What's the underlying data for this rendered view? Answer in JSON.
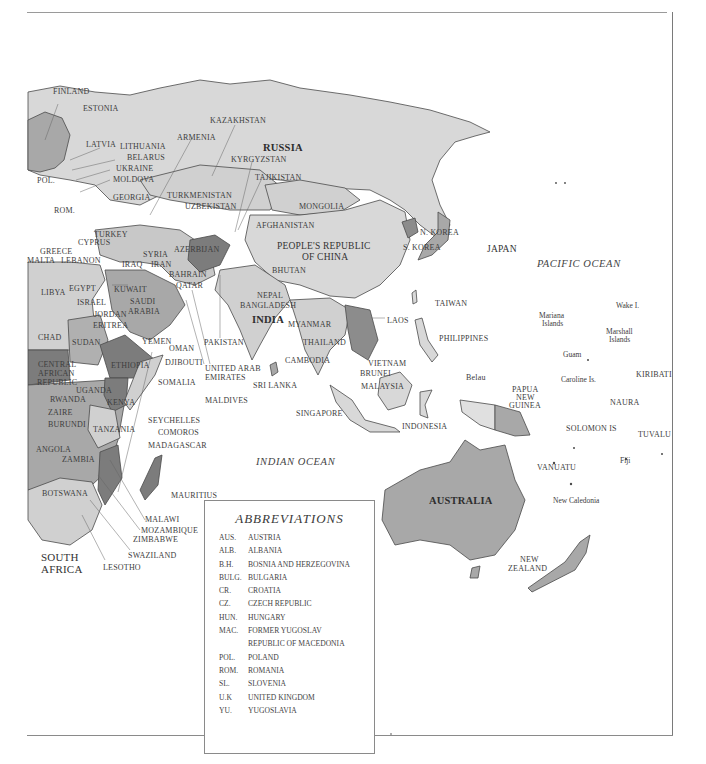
{
  "map": {
    "oceans": [
      {
        "id": "pacific",
        "label": "PACIFIC OCEAN",
        "x": 537,
        "y": 259
      },
      {
        "id": "indian",
        "label": "INDIAN OCEAN",
        "x": 256,
        "y": 457
      }
    ],
    "major_labels": [
      {
        "id": "russia",
        "label": "RUSSIA",
        "x": 263,
        "y": 142
      },
      {
        "id": "china-1",
        "label": "PEOPLE'S REPUBLIC",
        "x": 277,
        "y": 241
      },
      {
        "id": "china-2",
        "label": "OF CHINA",
        "x": 302,
        "y": 252
      },
      {
        "id": "india",
        "label": "INDIA",
        "x": 252,
        "y": 314
      },
      {
        "id": "japan",
        "label": "JAPAN",
        "x": 487,
        "y": 244
      },
      {
        "id": "australia",
        "label": "AUSTRALIA",
        "x": 429,
        "y": 495
      },
      {
        "id": "south-africa-1",
        "label": "SOUTH",
        "x": 41,
        "y": 552
      },
      {
        "id": "south-africa-2",
        "label": "AFRICA",
        "x": 41,
        "y": 564
      }
    ],
    "labels": [
      {
        "id": "finland",
        "label": "FINLAND",
        "x": 53,
        "y": 87
      },
      {
        "id": "estonia",
        "label": "ESTONIA",
        "x": 83,
        "y": 104
      },
      {
        "id": "kazakhstan",
        "label": "KAZAKHSTAN",
        "x": 210,
        "y": 116
      },
      {
        "id": "armenia",
        "label": "ARMENIA",
        "x": 177,
        "y": 133
      },
      {
        "id": "latvia",
        "label": "LATVIA",
        "x": 86,
        "y": 140
      },
      {
        "id": "lithuania",
        "label": "LITHUANIA",
        "x": 120,
        "y": 142
      },
      {
        "id": "belarus",
        "label": "BELARUS",
        "x": 127,
        "y": 153
      },
      {
        "id": "kyrgyzstan",
        "label": "KYRGYZSTAN",
        "x": 231,
        "y": 155
      },
      {
        "id": "ukraine",
        "label": "UKRAINE",
        "x": 116,
        "y": 164
      },
      {
        "id": "pol",
        "label": "POL.",
        "x": 37,
        "y": 176
      },
      {
        "id": "moldova",
        "label": "MOLDOVA",
        "x": 113,
        "y": 175
      },
      {
        "id": "tajikistan",
        "label": "TAJIKISTAN",
        "x": 255,
        "y": 173
      },
      {
        "id": "georgia",
        "label": "GEORGIA",
        "x": 113,
        "y": 193
      },
      {
        "id": "turkmenistan",
        "label": "TURKMENISTAN",
        "x": 167,
        "y": 191
      },
      {
        "id": "uzbekistan",
        "label": "UZBEKISTAN",
        "x": 185,
        "y": 202
      },
      {
        "id": "mongolia",
        "label": "MONGOLIA",
        "x": 299,
        "y": 202
      },
      {
        "id": "rom",
        "label": "ROM.",
        "x": 54,
        "y": 206
      },
      {
        "id": "afghanistan",
        "label": "AFGHANISTAN",
        "x": 256,
        "y": 221
      },
      {
        "id": "turkey",
        "label": "TURKEY",
        "x": 94,
        "y": 230
      },
      {
        "id": "cyprus",
        "label": "CYPRUS",
        "x": 78,
        "y": 238
      },
      {
        "id": "greece",
        "label": "GREECE",
        "x": 40,
        "y": 247
      },
      {
        "id": "syria",
        "label": "SYRIA",
        "x": 143,
        "y": 250
      },
      {
        "id": "azerbaijan",
        "label": "AZERBIJAN",
        "x": 174,
        "y": 245
      },
      {
        "id": "malta",
        "label": "MALTA",
        "x": 27,
        "y": 256
      },
      {
        "id": "lebanon",
        "label": "LEBANON",
        "x": 61,
        "y": 256
      },
      {
        "id": "iraq",
        "label": "IRAQ",
        "x": 122,
        "y": 260
      },
      {
        "id": "iran",
        "label": "IRAN",
        "x": 151,
        "y": 260
      },
      {
        "id": "n-korea",
        "label": "N. KOREA",
        "x": 420,
        "y": 228
      },
      {
        "id": "s-korea",
        "label": "S. KOREA",
        "x": 403,
        "y": 243
      },
      {
        "id": "bhutan",
        "label": "BHUTAN",
        "x": 272,
        "y": 266
      },
      {
        "id": "bahrain",
        "label": "BAHRAIN",
        "x": 169,
        "y": 270
      },
      {
        "id": "qatar",
        "label": "QATAR",
        "x": 176,
        "y": 281
      },
      {
        "id": "libya",
        "label": "LIBYA",
        "x": 41,
        "y": 288
      },
      {
        "id": "egypt",
        "label": "EGYPT",
        "x": 69,
        "y": 284
      },
      {
        "id": "kuwait",
        "label": "KUWAIT",
        "x": 114,
        "y": 285
      },
      {
        "id": "nepal",
        "label": "NEPAL",
        "x": 257,
        "y": 291
      },
      {
        "id": "bangladesh",
        "label": "BANGLADESH",
        "x": 240,
        "y": 301
      },
      {
        "id": "israel",
        "label": "ISRAEL",
        "x": 77,
        "y": 298
      },
      {
        "id": "saudi-1",
        "label": "SAUDI",
        "x": 130,
        "y": 297
      },
      {
        "id": "saudi-2",
        "label": "ARABIA",
        "x": 128,
        "y": 307
      },
      {
        "id": "taiwan",
        "label": "TAIWAN",
        "x": 435,
        "y": 299
      },
      {
        "id": "laos",
        "label": "LAOS",
        "x": 387,
        "y": 316
      },
      {
        "id": "jordan",
        "label": "JORDAN",
        "x": 94,
        "y": 310
      },
      {
        "id": "myanmar",
        "label": "MYANMAR",
        "x": 288,
        "y": 320
      },
      {
        "id": "eritrea",
        "label": "ERITREA",
        "x": 93,
        "y": 321
      },
      {
        "id": "chad",
        "label": "CHAD",
        "x": 38,
        "y": 333
      },
      {
        "id": "sudan",
        "label": "SUDAN",
        "x": 72,
        "y": 338
      },
      {
        "id": "yemen",
        "label": "YEMEN",
        "x": 142,
        "y": 337
      },
      {
        "id": "pakistan",
        "label": "PAKISTAN",
        "x": 204,
        "y": 338
      },
      {
        "id": "thailand",
        "label": "THAILAND",
        "x": 303,
        "y": 338
      },
      {
        "id": "philippines",
        "label": "PHILIPPINES",
        "x": 439,
        "y": 334
      },
      {
        "id": "oman",
        "label": "OMAN",
        "x": 169,
        "y": 344
      },
      {
        "id": "cambodia",
        "label": "CAMBODIA",
        "x": 285,
        "y": 356
      },
      {
        "id": "car-1",
        "label": "CENTRAL",
        "x": 38,
        "y": 360
      },
      {
        "id": "car-2",
        "label": "AFRICAN",
        "x": 38,
        "y": 369
      },
      {
        "id": "car-3",
        "label": "REPUBLIC",
        "x": 37,
        "y": 378
      },
      {
        "id": "ethiopia",
        "label": "ETHIOPIA",
        "x": 111,
        "y": 361
      },
      {
        "id": "djibouti",
        "label": "DJIBOUTI",
        "x": 165,
        "y": 358
      },
      {
        "id": "uae-1",
        "label": "UNITED ARAB",
        "x": 205,
        "y": 364
      },
      {
        "id": "uae-2",
        "label": "EMIRATES",
        "x": 205,
        "y": 373
      },
      {
        "id": "vietnam",
        "label": "VIETNAM",
        "x": 368,
        "y": 359
      },
      {
        "id": "brunei",
        "label": "BRUNEI",
        "x": 360,
        "y": 369
      },
      {
        "id": "belau",
        "label": "Belau",
        "x": 466,
        "y": 373
      },
      {
        "id": "somalia",
        "label": "SOMALIA",
        "x": 158,
        "y": 378
      },
      {
        "id": "sri-lanka",
        "label": "SRI LANKA",
        "x": 253,
        "y": 381
      },
      {
        "id": "malaysia",
        "label": "MALAYSIA",
        "x": 361,
        "y": 382
      },
      {
        "id": "uganda",
        "label": "UGANDA",
        "x": 76,
        "y": 386
      },
      {
        "id": "rwanda",
        "label": "RWANDA",
        "x": 50,
        "y": 395
      },
      {
        "id": "kenya",
        "label": "KENYA",
        "x": 107,
        "y": 398
      },
      {
        "id": "maldives",
        "label": "MALDIVES",
        "x": 205,
        "y": 396
      },
      {
        "id": "zaire",
        "label": "ZAIRE",
        "x": 48,
        "y": 408
      },
      {
        "id": "singapore",
        "label": "SINGAPORE",
        "x": 296,
        "y": 409
      },
      {
        "id": "burundi",
        "label": "BURUNDI",
        "x": 48,
        "y": 420
      },
      {
        "id": "seychelles",
        "label": "SEYCHELLES",
        "x": 148,
        "y": 416
      },
      {
        "id": "tanzania",
        "label": "TANZANIA",
        "x": 93,
        "y": 425
      },
      {
        "id": "indonesia",
        "label": "INDONESIA",
        "x": 402,
        "y": 422
      },
      {
        "id": "comoros",
        "label": "COMOROS",
        "x": 158,
        "y": 428
      },
      {
        "id": "madagascar",
        "label": "MADAGASCAR",
        "x": 148,
        "y": 441
      },
      {
        "id": "angola",
        "label": "ANGOLA",
        "x": 36,
        "y": 445
      },
      {
        "id": "zambia",
        "label": "ZAMBIA",
        "x": 62,
        "y": 455
      },
      {
        "id": "botswana",
        "label": "BOTSWANA",
        "x": 42,
        "y": 489
      },
      {
        "id": "mauritius",
        "label": "MAURITIUS",
        "x": 171,
        "y": 491
      },
      {
        "id": "malawi",
        "label": "MALAWI",
        "x": 145,
        "y": 515
      },
      {
        "id": "mozambique",
        "label": "MOZAMBIQUE",
        "x": 141,
        "y": 526
      },
      {
        "id": "zimbabwe",
        "label": "ZIMBABWE",
        "x": 133,
        "y": 535
      },
      {
        "id": "swaziland",
        "label": "SWAZILAND",
        "x": 128,
        "y": 551
      },
      {
        "id": "lesotho",
        "label": "LESOTHO",
        "x": 103,
        "y": 563
      },
      {
        "id": "png-1",
        "label": "PAPUA",
        "x": 512,
        "y": 385
      },
      {
        "id": "png-2",
        "label": "NEW",
        "x": 516,
        "y": 393
      },
      {
        "id": "png-3",
        "label": "GUINEA",
        "x": 509,
        "y": 401
      },
      {
        "id": "solomon",
        "label": "SOLOMON IS",
        "x": 566,
        "y": 424
      },
      {
        "id": "kiribati",
        "label": "KIRIBATI",
        "x": 636,
        "y": 370
      },
      {
        "id": "naura",
        "label": "NAURA",
        "x": 610,
        "y": 398
      },
      {
        "id": "tuvalu",
        "label": "TUVALU",
        "x": 638,
        "y": 430
      },
      {
        "id": "vanuatu",
        "label": "VANUATU",
        "x": 537,
        "y": 463
      },
      {
        "id": "new-zealand-1",
        "label": "NEW",
        "x": 520,
        "y": 555
      },
      {
        "id": "new-zealand-2",
        "label": "ZEALAND",
        "x": 508,
        "y": 564
      }
    ],
    "small_labels": [
      {
        "id": "mariana-1",
        "label": "Mariana",
        "x": 539,
        "y": 311
      },
      {
        "id": "mariana-2",
        "label": "Islands",
        "x": 542,
        "y": 319
      },
      {
        "id": "wake",
        "label": "Wake I.",
        "x": 616,
        "y": 301
      },
      {
        "id": "marshall-1",
        "label": "Marshall",
        "x": 606,
        "y": 327
      },
      {
        "id": "marshall-2",
        "label": "Islands",
        "x": 609,
        "y": 335
      },
      {
        "id": "guam",
        "label": "Guam",
        "x": 563,
        "y": 350
      },
      {
        "id": "caroline",
        "label": "Caroline Is.",
        "x": 561,
        "y": 375
      },
      {
        "id": "fiji",
        "label": "Fiji",
        "x": 620,
        "y": 456
      },
      {
        "id": "new-caledonia",
        "label": "New Caledonia",
        "x": 553,
        "y": 496
      }
    ]
  },
  "legend": {
    "title": "ABBREVIATIONS",
    "items": [
      {
        "abbr": "AUS.",
        "name": "AUSTRIA"
      },
      {
        "abbr": "ALB.",
        "name": "ALBANIA"
      },
      {
        "abbr": "B.H.",
        "name": "BOSNIA AND HERZEGOVINA"
      },
      {
        "abbr": "BULG.",
        "name": "BULGARIA"
      },
      {
        "abbr": "CR.",
        "name": "CROATIA"
      },
      {
        "abbr": "CZ.",
        "name": "CZECH REPUBLIC"
      },
      {
        "abbr": "HUN.",
        "name": "HUNGARY"
      },
      {
        "abbr": "MAC.",
        "name": "FORMER YUGOSLAV"
      },
      {
        "abbr": "",
        "name": "REPUBLIC OF MACEDONIA"
      },
      {
        "abbr": "POL.",
        "name": "POLAND"
      },
      {
        "abbr": "ROM.",
        "name": "ROMANIA"
      },
      {
        "abbr": "SL.",
        "name": "SLOVENIA"
      },
      {
        "abbr": "U.K",
        "name": "UNITED KINGDOM"
      },
      {
        "abbr": "YU.",
        "name": "YUGOSLAVIA"
      }
    ]
  },
  "colors": {
    "light": "#d6d6d6",
    "medium": "#a8a8a8",
    "dark": "#7c7c7c",
    "border": "#4a4a4a",
    "water": "#ffffff"
  }
}
